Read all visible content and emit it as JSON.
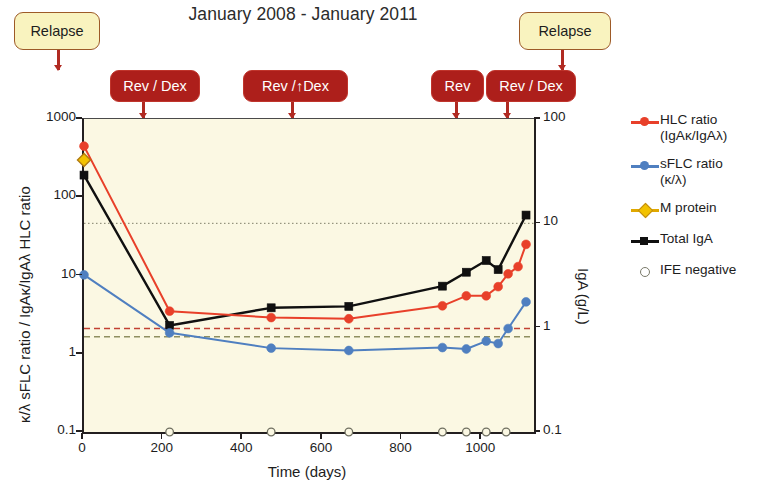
{
  "title": "January 2008 - January 2011",
  "colors": {
    "hlc": "#e8402a",
    "sflc": "#4f7fc0",
    "mprotein": "#f2c200",
    "iga": "#101010",
    "ife": "#7a7a6a",
    "plot_bg": "#fbf8e3",
    "treatment_box": "#ad1f1b",
    "relapse_box": "#f9f3bf",
    "arrow": "#b02a22"
  },
  "annotations": [
    {
      "label": "Relapse",
      "type": "relapse",
      "day": 0,
      "box_left": 14,
      "box_top": 12,
      "box_w": 86,
      "box_h": 38,
      "arrow_x": 57,
      "arrow_top": 50,
      "arrow_h": 20
    },
    {
      "label": "Rev / Dex",
      "type": "treat",
      "day": 133,
      "box_left": 110,
      "box_top": 70,
      "box_w": 90,
      "box_h": 32,
      "arrow_x": 142,
      "arrow_top": 102,
      "arrow_h": 16
    },
    {
      "label": "Rev /↑Dex",
      "type": "treat",
      "day": 464,
      "box_left": 243,
      "box_top": 70,
      "box_w": 105,
      "box_h": 32,
      "arrow_x": 291,
      "arrow_top": 102,
      "arrow_h": 16
    },
    {
      "label": "Rev",
      "type": "treat",
      "day": 829,
      "box_left": 431,
      "box_top": 70,
      "box_w": 53,
      "box_h": 32,
      "arrow_x": 455,
      "arrow_top": 102,
      "arrow_h": 16
    },
    {
      "label": "Rev / Dex",
      "type": "treat",
      "day": 942,
      "box_left": 486,
      "box_top": 70,
      "box_w": 90,
      "box_h": 32,
      "arrow_x": 506,
      "arrow_top": 102,
      "arrow_h": 16
    },
    {
      "label": "Relapse",
      "type": "relapse",
      "day": 942,
      "box_left": 519,
      "box_top": 12,
      "box_w": 92,
      "box_h": 38,
      "arrow_x": 561,
      "arrow_top": 50,
      "arrow_h": 20
    }
  ],
  "legend": [
    {
      "label_line1": "HLC ratio",
      "label_line2": "(IgAκ/IgAλ)",
      "color": "#e8402a",
      "marker": "circle",
      "line": true,
      "name": "hlc-ratio"
    },
    {
      "label_line1": "sFLC ratio",
      "label_line2": "(κ/λ)",
      "color": "#4f7fc0",
      "marker": "circle",
      "line": true,
      "name": "sflc-ratio"
    },
    {
      "label_line1": "M protein",
      "label_line2": "",
      "color": "#f2c200",
      "marker": "diamond",
      "line": true,
      "name": "m-protein"
    },
    {
      "label_line1": "Total IgA",
      "label_line2": "",
      "color": "#101010",
      "marker": "square",
      "line": true,
      "name": "total-iga"
    },
    {
      "label_line1": "IFE negative",
      "label_line2": "",
      "color": "#7a7a6a",
      "marker": "open-circle",
      "line": false,
      "name": "ife-negative"
    }
  ],
  "chart_data": {
    "type": "line",
    "title": "January 2008 - January 2011",
    "xlabel": "Time (days)",
    "ylabel_left": "κ/λ sFLC ratio / IgAκ/IgAλ HLC ratio",
    "ylabel_right": "IgA (g/L)",
    "xlim": [
      0,
      1130
    ],
    "xticks": [
      0,
      200,
      400,
      600,
      800,
      1000
    ],
    "xtick_labels": [
      "0",
      "200",
      "400",
      "600",
      "800",
      "1000"
    ],
    "yscale": "log",
    "ylim_left": [
      0.1,
      1000
    ],
    "yticks_left": [
      0.1,
      1,
      10,
      100,
      1000
    ],
    "ytick_labels_left": [
      "0.1",
      "1",
      "10",
      "100",
      "1000"
    ],
    "ylim_right": [
      0.1,
      100
    ],
    "yticks_right": [
      0.1,
      1,
      10,
      100
    ],
    "ytick_labels_right": [
      "0.1",
      "1",
      "10",
      "100"
    ],
    "grid": false,
    "legend_position": "right",
    "reference_lines": [
      {
        "name": "iga-upper-normal",
        "axis": "right",
        "value": 10,
        "color": "#6b6b55",
        "style": "dotted"
      },
      {
        "name": "hlc-upper-normal",
        "axis": "left",
        "value": 2.1,
        "color": "#c0392b",
        "style": "dashed"
      },
      {
        "name": "sflc-upper-normal",
        "axis": "left",
        "value": 1.65,
        "color": "#8a8a5a",
        "style": "dashed"
      }
    ],
    "series": [
      {
        "name": "HLC ratio (IgAκ/IgAλ)",
        "axis": "left",
        "color": "#e8402a",
        "marker": "circle",
        "x": [
          0,
          215,
          470,
          665,
          900,
          960,
          1010,
          1040,
          1065,
          1090,
          1110
        ],
        "y": [
          450,
          3.5,
          2.9,
          2.8,
          4.1,
          5.5,
          5.5,
          7.2,
          10.5,
          13.0,
          25.0
        ]
      },
      {
        "name": "sFLC ratio (κ/λ)",
        "axis": "left",
        "color": "#4f7fc0",
        "marker": "circle",
        "x": [
          0,
          215,
          470,
          665,
          900,
          960,
          1010,
          1040,
          1065,
          1110
        ],
        "y": [
          10.2,
          1.85,
          1.18,
          1.1,
          1.2,
          1.15,
          1.45,
          1.35,
          2.1,
          4.6
        ]
      },
      {
        "name": "M protein",
        "axis": "left",
        "color": "#f2c200",
        "marker": "diamond",
        "x": [
          0
        ],
        "y": [
          300
        ]
      },
      {
        "name": "Total IgA",
        "axis": "right",
        "color": "#101010",
        "marker": "square",
        "x": [
          0,
          215,
          470,
          665,
          900,
          960,
          1010,
          1040,
          1110
        ],
        "y": [
          29.0,
          1.05,
          1.55,
          1.6,
          2.5,
          3.4,
          4.4,
          3.6,
          12.0
        ]
      },
      {
        "name": "IFE negative",
        "axis": "baseline",
        "color": "#7a7a6a",
        "marker": "open-circle",
        "x": [
          215,
          470,
          665,
          900,
          960,
          1010,
          1060
        ],
        "y": [
          0.1,
          0.1,
          0.1,
          0.1,
          0.1,
          0.1,
          0.1
        ]
      }
    ]
  }
}
